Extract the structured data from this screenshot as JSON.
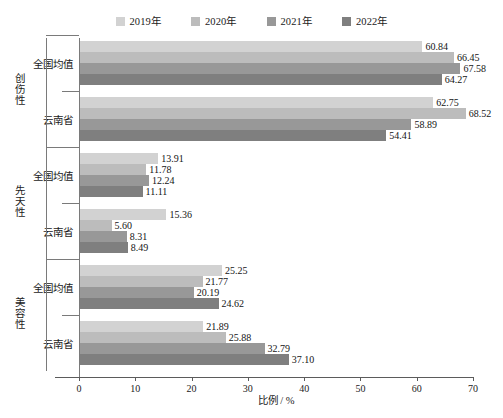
{
  "chart_data": {
    "type": "bar",
    "orientation": "horizontal",
    "title": "",
    "xlabel": "比例 / %",
    "ylabel": "",
    "xlim": [
      0,
      70
    ],
    "xticks": [
      0,
      10,
      20,
      30,
      40,
      50,
      60,
      70
    ],
    "grid": false,
    "legend_position": "top-center",
    "series": [
      {
        "name": "2019年",
        "color": "#d2d2d2"
      },
      {
        "name": "2020年",
        "color": "#bcbcbc"
      },
      {
        "name": "2021年",
        "color": "#989898"
      },
      {
        "name": "2022年",
        "color": "#7f7f7f"
      }
    ],
    "groups": [
      {
        "label": "创伤性",
        "subgroups": [
          {
            "label": "全国均值",
            "values": [
              60.84,
              66.45,
              67.58,
              64.27
            ]
          },
          {
            "label": "云南省",
            "values": [
              62.75,
              68.52,
              58.89,
              54.41
            ]
          }
        ]
      },
      {
        "label": "先天性",
        "subgroups": [
          {
            "label": "全国均值",
            "values": [
              13.91,
              11.78,
              12.24,
              11.11
            ]
          },
          {
            "label": "云南省",
            "values": [
              15.36,
              5.6,
              8.31,
              8.49
            ]
          }
        ]
      },
      {
        "label": "美容性",
        "subgroups": [
          {
            "label": "全国均值",
            "values": [
              25.25,
              21.77,
              20.19,
              24.62
            ]
          },
          {
            "label": "云南省",
            "values": [
              21.89,
              25.88,
              32.79,
              37.1
            ]
          }
        ]
      }
    ],
    "value_labels": [
      "60.84",
      "66.45",
      "67.58",
      "64.27",
      "62.75",
      "68.52",
      "58.89",
      "54.41",
      "13.91",
      "11.78",
      "12.24",
      "11.11",
      "15.36",
      "5.60",
      "8.31",
      "8.49",
      "25.25",
      "21.77",
      "20.19",
      "24.62",
      "21.89",
      "25.88",
      "32.79",
      "37.10"
    ]
  },
  "legend": {
    "items": [
      {
        "label": "2019年",
        "color": "#d2d2d2"
      },
      {
        "label": "2020年",
        "color": "#bcbcbc"
      },
      {
        "label": "2021年",
        "color": "#989898"
      },
      {
        "label": "2022年",
        "color": "#7f7f7f"
      }
    ]
  },
  "axis": {
    "x_title": "比例 / %",
    "x_tick_labels": [
      "0",
      "10",
      "20",
      "30",
      "40",
      "50",
      "60",
      "70"
    ]
  }
}
